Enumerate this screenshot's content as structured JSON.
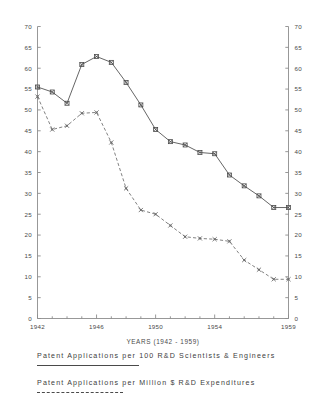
{
  "chart_data": {
    "type": "line",
    "title": "",
    "xlabel": "YEARS (1942 - 1959)",
    "ylabel": "",
    "x": [
      1942,
      1943,
      1944,
      1945,
      1946,
      1947,
      1948,
      1949,
      1950,
      1951,
      1952,
      1953,
      1954,
      1955,
      1956,
      1957,
      1958,
      1959
    ],
    "xlim": [
      1942,
      1959
    ],
    "ylim": [
      0,
      70
    ],
    "ytick_step": 5,
    "xticks": [
      "1942",
      "1946",
      "1950",
      "1954",
      "1959"
    ],
    "yticks": [
      "0",
      "5",
      "10",
      "15",
      "20",
      "25",
      "30",
      "35",
      "40",
      "45",
      "50",
      "55",
      "60",
      "65",
      "70"
    ],
    "grid": false,
    "legend_position": "below",
    "dual_axis": true,
    "series": [
      {
        "name": "Patent Applications per 100 R&D Scientists & Engineers",
        "style": "solid",
        "marker": "x-square",
        "color": "#4a4a4a",
        "values": [
          55.5,
          54.3,
          51.6,
          60.9,
          62.8,
          61.4,
          56.6,
          51.2,
          45.3,
          42.4,
          41.6,
          39.8,
          39.5,
          34.4,
          31.8,
          29.4,
          26.6,
          26.6
        ]
      },
      {
        "name": "Patent Applications per Million $ R&D Expenditures",
        "style": "dashed",
        "marker": "x-dot",
        "color": "#6b6b6b",
        "values": [
          53.2,
          45.3,
          46.2,
          49.2,
          49.4,
          42.2,
          31.2,
          26.0,
          25.0,
          22.3,
          19.6,
          19.2,
          19.0,
          18.5,
          14.0,
          11.7,
          9.4,
          9.4
        ]
      }
    ]
  },
  "axis": {
    "x_title": "YEARS (1942 - 1959)"
  },
  "legend": {
    "items": [
      {
        "label": "Patent Applications per 100 R&D Scientists & Engineers",
        "style": "solid"
      },
      {
        "label": "Patent Applications per Million $ R&D Expenditures",
        "style": "dashed"
      }
    ]
  }
}
